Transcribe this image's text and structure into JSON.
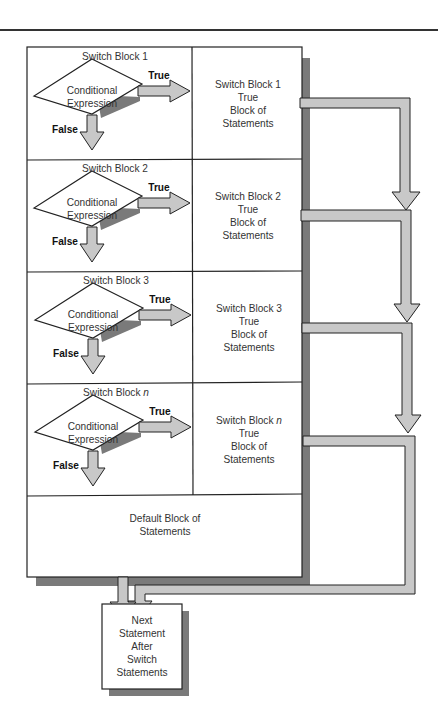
{
  "diagram": {
    "title_rule": true,
    "blocks": [
      {
        "header": "Switch Block 1",
        "header_base": "Switch Block ",
        "header_var": "1",
        "condition_line1": "Conditional",
        "condition_line2": "Expression",
        "true_label": "True",
        "false_label": "False",
        "body_line1": "Switch Block 1",
        "body_line1_base": "Switch Block ",
        "body_line1_var": "1",
        "body_line2": "True",
        "body_line3": "Block of",
        "body_line4": "Statements"
      },
      {
        "header": "Switch Block 2",
        "header_base": "Switch Block ",
        "header_var": "2",
        "condition_line1": "Conditional",
        "condition_line2": "Expression",
        "true_label": "True",
        "false_label": "False",
        "body_line1": "Switch Block 2",
        "body_line1_base": "Switch Block ",
        "body_line1_var": "2",
        "body_line2": "True",
        "body_line3": "Block of",
        "body_line4": "Statements"
      },
      {
        "header": "Switch Block 3",
        "header_base": "Switch Block ",
        "header_var": "3",
        "condition_line1": "Conditional",
        "condition_line2": "Expression",
        "true_label": "True",
        "false_label": "False",
        "body_line1": "Switch Block 3",
        "body_line1_base": "Switch Block ",
        "body_line1_var": "3",
        "body_line2": "True",
        "body_line3": "Block of",
        "body_line4": "Statements"
      },
      {
        "header": "Switch Block n",
        "header_base": "Switch Block ",
        "header_var": "n",
        "condition_line1": "Conditional",
        "condition_line2": "Expression",
        "true_label": "True",
        "false_label": "False",
        "body_line1": "Switch Block n",
        "body_line1_base": "Switch Block ",
        "body_line1_var": "n",
        "body_line2": "True",
        "body_line3": "Block of",
        "body_line4": "Statements"
      }
    ],
    "default_block": {
      "line1": "Default Block of",
      "line2": "Statements"
    },
    "next_statement": {
      "line1": "Next",
      "line2": "Statement",
      "line3": "After",
      "line4": "Switch",
      "line5": "Statements"
    },
    "colors": {
      "arrow_fill": "#c8c8c8",
      "shadow": "#7a7a7a",
      "stroke": "#222222",
      "background": "#ffffff"
    }
  }
}
